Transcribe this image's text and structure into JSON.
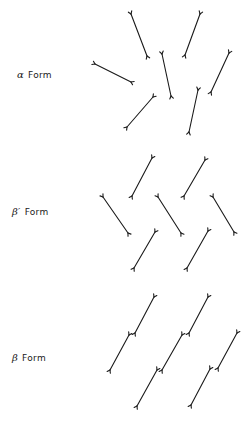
{
  "diagram": {
    "type": "crystal-packing-schematic",
    "ink_color": "#1a1a1a",
    "background": "#ffffff",
    "panels": [
      {
        "id": "alpha",
        "label_symbol": "α",
        "label_text": "Form",
        "label_pos": [
          24,
          75
        ],
        "molecules": [
          [
            131,
            14,
            147,
            56
          ],
          [
            200,
            14,
            185,
            55
          ],
          [
            162,
            54,
            171,
            96
          ],
          [
            95,
            64,
            131,
            82
          ],
          [
            229,
            53,
            211,
            92
          ],
          [
            153,
            97,
            127,
            127
          ],
          [
            198,
            90,
            189,
            132
          ]
        ]
      },
      {
        "id": "beta-prime",
        "label_symbol": "β′",
        "label_text": "Form",
        "label_pos": [
          18,
          212
        ],
        "molecules": [
          [
            152,
            158,
            132,
            196
          ],
          [
            205,
            160,
            184,
            196
          ],
          [
            103,
            197,
            128,
            233
          ],
          [
            158,
            197,
            181,
            233
          ],
          [
            213,
            197,
            234,
            232
          ],
          [
            155,
            232,
            134,
            268
          ],
          [
            208,
            231,
            187,
            268
          ]
        ]
      },
      {
        "id": "beta",
        "label_symbol": "β",
        "label_text": "Form",
        "label_pos": [
          18,
          358
        ],
        "molecules": [
          [
            154,
            297,
            135,
            333
          ],
          [
            129,
            335,
            110,
            370
          ],
          [
            208,
            297,
            189,
            333
          ],
          [
            182,
            335,
            162,
            370
          ],
          [
            157,
            370,
            137,
            406
          ],
          [
            237,
            333,
            218,
            368
          ],
          [
            210,
            369,
            191,
            405
          ]
        ]
      }
    ]
  }
}
